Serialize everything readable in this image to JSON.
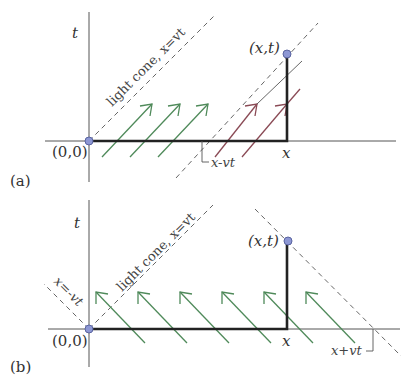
{
  "panel_a": {
    "tag": "(a)",
    "t_axis_label": "t",
    "x_label": "x",
    "origin_label": "(0,0)",
    "point_label": "(x,t)",
    "light_cone_label": "light cone, x=vt",
    "intercept_label": "x-vt",
    "arrow_direction": "right-moving",
    "colors": {
      "arrows_outside": "#4f8a5a",
      "arrows_inside": "#8a4a55",
      "point": "#8d97d4"
    }
  },
  "panel_b": {
    "tag": "(b)",
    "t_axis_label": "t",
    "x_label": "x",
    "origin_label": "(0,0)",
    "point_label": "(x,t)",
    "light_cone_label": "light cone, x=vt",
    "left_cone_label": "x=-vt",
    "intercept_label": "x+vt",
    "arrow_direction": "left-moving",
    "colors": {
      "arrows": "#4f8a5a",
      "point": "#8d97d4"
    }
  }
}
